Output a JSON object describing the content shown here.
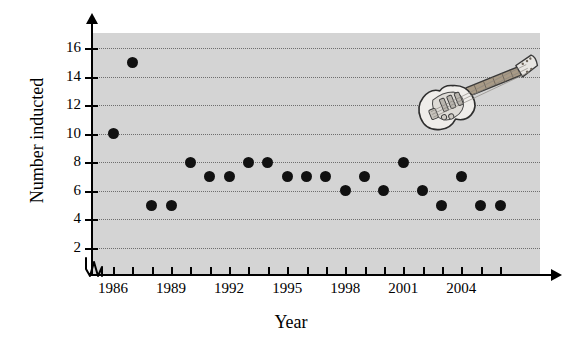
{
  "chart_data": {
    "type": "scatter",
    "title": "",
    "xlabel": "Year",
    "ylabel": "Number inducted",
    "xlim": [
      1985.5,
      2007
    ],
    "ylim": [
      0,
      17
    ],
    "grid": true,
    "legend": false,
    "x_tick_labels": [
      "1986",
      "1989",
      "1992",
      "1995",
      "1998",
      "2001",
      "2004"
    ],
    "x_tick_values": [
      1986,
      1989,
      1992,
      1995,
      1998,
      2001,
      2004
    ],
    "x_all_ticks": [
      1986,
      1987,
      1988,
      1989,
      1990,
      1991,
      1992,
      1993,
      1994,
      1995,
      1996,
      1997,
      1998,
      1999,
      2000,
      2001,
      2002,
      2003,
      2004,
      2005,
      2006
    ],
    "y_tick_labels": [
      "2",
      "4",
      "6",
      "8",
      "10",
      "12",
      "14",
      "16"
    ],
    "y_tick_values": [
      2,
      4,
      6,
      8,
      10,
      12,
      14,
      16
    ],
    "axis_break": true,
    "point_color": "#111111",
    "plot_background_color": "#d4d4d4",
    "gridline_color": "#6e6e6e",
    "x": [
      1986,
      1987,
      1988,
      1989,
      1990,
      1991,
      1992,
      1993,
      1994,
      1995,
      1996,
      1997,
      1998,
      1999,
      2000,
      2001,
      2002,
      2003,
      2004,
      2005,
      2006
    ],
    "values": [
      10,
      15,
      5,
      5,
      8,
      7,
      7,
      8,
      8,
      7,
      7,
      7,
      6,
      7,
      6,
      8,
      6,
      5,
      7,
      5,
      5
    ],
    "points": [
      {
        "year": 1986,
        "value": 10
      },
      {
        "year": 1987,
        "value": 15
      },
      {
        "year": 1988,
        "value": 5
      },
      {
        "year": 1989,
        "value": 5
      },
      {
        "year": 1990,
        "value": 8
      },
      {
        "year": 1991,
        "value": 7
      },
      {
        "year": 1992,
        "value": 7
      },
      {
        "year": 1993,
        "value": 8
      },
      {
        "year": 1994,
        "value": 8
      },
      {
        "year": 1995,
        "value": 7
      },
      {
        "year": 1996,
        "value": 7
      },
      {
        "year": 1997,
        "value": 7
      },
      {
        "year": 1998,
        "value": 6
      },
      {
        "year": 1999,
        "value": 7
      },
      {
        "year": 2000,
        "value": 6
      },
      {
        "year": 2001,
        "value": 8
      },
      {
        "year": 2002,
        "value": 6
      },
      {
        "year": 2003,
        "value": 5
      },
      {
        "year": 2004,
        "value": 7
      },
      {
        "year": 2005,
        "value": 5
      },
      {
        "year": 2006,
        "value": 5
      }
    ],
    "decoration": "electric-guitar-icon"
  }
}
